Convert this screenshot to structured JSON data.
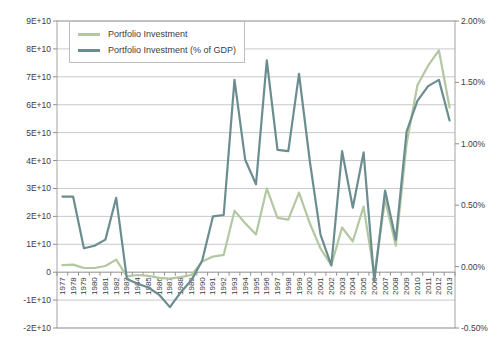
{
  "window": {
    "background": "#ffffff"
  },
  "legend": {
    "items": [
      {
        "label": "Portfolio Investment",
        "color": "#b3c7a2"
      },
      {
        "label": "Portfolio Investment (% of GDP)",
        "color": "#6b8d90"
      }
    ]
  },
  "colors": {
    "gridline": "#c9c9c9",
    "frame": "#a3a3a3",
    "zero_axis": "#8f8f8f",
    "tick": "#8f8f8f",
    "label_text": "#3c3c3c",
    "series_light": "#b3c7a2",
    "series_dark": "#6b8d90"
  },
  "chart_data": {
    "type": "line",
    "title": "",
    "x": [
      "1977",
      "1978",
      "1979",
      "1980",
      "1981",
      "1982",
      "1983",
      "1984",
      "1985",
      "1986",
      "1987",
      "1988",
      "1989",
      "1990",
      "1991",
      "1992",
      "1993",
      "1994",
      "1995",
      "1996",
      "1997",
      "1998",
      "1999",
      "2000",
      "2001",
      "2002",
      "2003",
      "2004",
      "2005",
      "2006",
      "2007",
      "2008",
      "2009",
      "2010",
      "2011",
      "2012",
      "2013"
    ],
    "series": [
      {
        "name": "Portfolio Investment",
        "axis": "left",
        "unit": "USD, left axis values are in units of 1E+10",
        "color": "#b3c7a2",
        "values": [
          0.25,
          0.27,
          0.15,
          0.15,
          0.22,
          0.45,
          -0.15,
          -0.1,
          -0.13,
          -0.2,
          -0.23,
          -0.18,
          -0.1,
          0.38,
          0.56,
          0.62,
          2.2,
          1.75,
          1.35,
          3.0,
          1.95,
          1.88,
          2.85,
          1.75,
          0.85,
          0.25,
          1.6,
          1.1,
          2.35,
          -0.1,
          2.6,
          0.95,
          4.6,
          6.7,
          7.4,
          7.95,
          5.9
        ]
      },
      {
        "name": "Portfolio Investment (% of GDP)",
        "axis": "right",
        "unit": "percent of GDP",
        "color": "#6b8d90",
        "values": [
          0.57,
          0.57,
          0.15,
          0.17,
          0.22,
          0.56,
          -0.1,
          -0.14,
          -0.17,
          -0.23,
          -0.33,
          -0.21,
          -0.11,
          0.05,
          0.41,
          0.42,
          1.52,
          0.87,
          0.67,
          1.68,
          0.95,
          0.94,
          1.57,
          0.86,
          0.26,
          0.01,
          0.94,
          0.48,
          0.93,
          -0.12,
          0.62,
          0.22,
          1.1,
          1.35,
          1.47,
          1.52,
          1.19
        ]
      }
    ],
    "left_axis": {
      "min": -2,
      "max": 9,
      "tick_values": [
        9,
        8,
        7,
        6,
        5,
        4,
        3,
        2,
        1,
        0,
        -1,
        -2
      ],
      "tick_labels": [
        "9E+10",
        "8E+10",
        "7E+10",
        "6E+10",
        "5E+10",
        "4E+10",
        "3E+10",
        "2E+10",
        "1E+10",
        "0",
        "-1E+10",
        "-2E+10"
      ]
    },
    "right_axis": {
      "min": -0.5,
      "max": 2.0,
      "tick_values": [
        2.0,
        1.5,
        1.0,
        0.5,
        0.0,
        -0.5
      ],
      "tick_labels": [
        "2.00%",
        "1.50%",
        "1.00%",
        "0.50%",
        "0.00%",
        "-0.50%"
      ]
    },
    "grid": "horizontal gridlines at every left-axis tick (1E+10 steps)",
    "legend_position": "inside top-left",
    "x_label_rotation": -90
  }
}
